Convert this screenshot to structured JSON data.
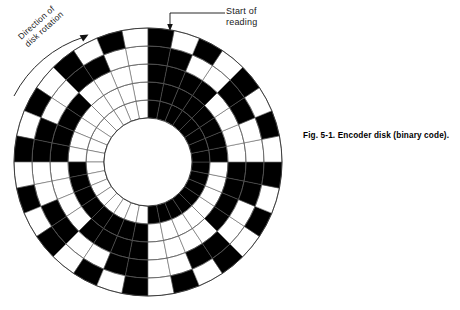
{
  "figure": {
    "caption_label": "Fig. 5-1.",
    "caption_text": "Encoder disk (binary code).",
    "caption_full": "Fig. 5-1. Encoder disk (binary code)."
  },
  "annotations": {
    "start_of_reading": "Start of\nreading",
    "direction_of_rotation": "Direction of\ndisk rotation"
  },
  "colors": {
    "ink": "#000000",
    "paper": "#ffffff",
    "line": "#555555",
    "text": "#1a1a1a"
  },
  "disk": {
    "center_x": 148,
    "center_y": 162,
    "outer_radius": 134,
    "hub_radius": 44,
    "ring_count": 5,
    "sector_count": 32,
    "start_angle_deg": -90,
    "rotation_direction": "counterclockwise",
    "ring_radii": [
      44,
      62,
      80,
      98,
      116,
      134
    ],
    "ring_labels": [
      "bit-1-innermost",
      "bit-2",
      "bit-3",
      "bit-4",
      "bit-5-outermost"
    ]
  },
  "chart_data": {
    "type": "heatmap",
    "title": "Encoder disk (binary code)",
    "categories": [
      "sector-0",
      "sector-1",
      "sector-2",
      "sector-3",
      "sector-4",
      "sector-5",
      "sector-6",
      "sector-7",
      "sector-8",
      "sector-9",
      "sector-10",
      "sector-11",
      "sector-12",
      "sector-13",
      "sector-14",
      "sector-15",
      "sector-16",
      "sector-17",
      "sector-18",
      "sector-19",
      "sector-20",
      "sector-21",
      "sector-22",
      "sector-23",
      "sector-24",
      "sector-25",
      "sector-26",
      "sector-27",
      "sector-28",
      "sector-29",
      "sector-30",
      "sector-31"
    ],
    "series": [
      {
        "name": "bit-1-innermost",
        "ring_index": 0,
        "values": [
          0,
          0,
          0,
          0,
          0,
          0,
          0,
          0,
          0,
          0,
          0,
          0,
          0,
          0,
          0,
          0,
          1,
          1,
          1,
          1,
          1,
          1,
          1,
          1,
          1,
          1,
          1,
          1,
          1,
          1,
          1,
          1
        ]
      },
      {
        "name": "bit-2",
        "ring_index": 1,
        "values": [
          0,
          0,
          0,
          0,
          0,
          0,
          0,
          0,
          1,
          1,
          1,
          1,
          1,
          1,
          1,
          1,
          0,
          0,
          0,
          0,
          0,
          0,
          0,
          0,
          1,
          1,
          1,
          1,
          1,
          1,
          1,
          1
        ]
      },
      {
        "name": "bit-3",
        "ring_index": 2,
        "values": [
          0,
          0,
          0,
          0,
          1,
          1,
          1,
          1,
          0,
          0,
          0,
          0,
          1,
          1,
          1,
          1,
          0,
          0,
          0,
          0,
          1,
          1,
          1,
          1,
          0,
          0,
          0,
          0,
          1,
          1,
          1,
          1
        ]
      },
      {
        "name": "bit-4",
        "ring_index": 3,
        "values": [
          0,
          0,
          1,
          1,
          0,
          0,
          1,
          1,
          0,
          0,
          1,
          1,
          0,
          0,
          1,
          1,
          0,
          0,
          1,
          1,
          0,
          0,
          1,
          1,
          0,
          0,
          1,
          1,
          0,
          0,
          1,
          1
        ]
      },
      {
        "name": "bit-5-outermost",
        "ring_index": 4,
        "values": [
          0,
          1,
          0,
          1,
          0,
          1,
          0,
          1,
          0,
          1,
          0,
          1,
          0,
          1,
          0,
          1,
          0,
          1,
          0,
          1,
          0,
          1,
          0,
          1,
          0,
          1,
          0,
          1,
          0,
          1,
          0,
          1
        ]
      }
    ],
    "legend": [
      "black = 1 (opaque)",
      "white = 0 (clear)"
    ],
    "xlabel": "angular sector",
    "ylabel": "track (bit weight)",
    "grid": true
  }
}
